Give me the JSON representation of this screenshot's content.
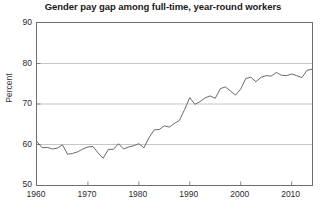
{
  "chart_data": {
    "type": "line",
    "title": "Gender pay gap among full-time, year-round workers",
    "xlabel": "",
    "ylabel": "Percent",
    "xlim": [
      1960,
      2014
    ],
    "ylim": [
      50,
      90
    ],
    "yticks": [
      50,
      60,
      70,
      80,
      90
    ],
    "xticks": [
      1960,
      1970,
      1980,
      1990,
      2000,
      2010
    ],
    "ytick_labels": [
      "50",
      "60",
      "70",
      "80",
      "90"
    ],
    "xtick_labels": [
      "1960",
      "1970",
      "1980",
      "1990",
      "2000",
      "2010"
    ],
    "gridlines": [
      60,
      70,
      80
    ],
    "grid": true,
    "legend": null,
    "line_color": "#5a5a5a",
    "grid_color": "#b9b9b9",
    "axis_color": "#6d6d6d",
    "series": [
      {
        "name": "Women's earnings as a percent of men's",
        "x": [
          1960,
          1961,
          1962,
          1963,
          1964,
          1965,
          1966,
          1967,
          1968,
          1969,
          1970,
          1971,
          1972,
          1973,
          1974,
          1975,
          1976,
          1977,
          1978,
          1979,
          1980,
          1981,
          1982,
          1983,
          1984,
          1985,
          1986,
          1987,
          1988,
          1989,
          1990,
          1991,
          1992,
          1993,
          1994,
          1995,
          1996,
          1997,
          1998,
          1999,
          2000,
          2001,
          2002,
          2003,
          2004,
          2005,
          2006,
          2007,
          2008,
          2009,
          2010,
          2011,
          2012,
          2013,
          2014
        ],
        "values": [
          60.7,
          59.2,
          59.3,
          58.9,
          59.1,
          59.9,
          57.6,
          57.8,
          58.2,
          58.9,
          59.4,
          59.5,
          57.9,
          56.6,
          58.8,
          58.8,
          60.2,
          58.9,
          59.4,
          59.7,
          60.2,
          59.2,
          61.7,
          63.6,
          63.7,
          64.6,
          64.3,
          65.2,
          66.0,
          68.7,
          71.6,
          69.9,
          70.6,
          71.5,
          72.0,
          71.4,
          73.8,
          74.2,
          73.2,
          72.2,
          73.7,
          76.3,
          76.6,
          75.5,
          76.6,
          77.0,
          76.9,
          77.8,
          77.1,
          77.0,
          77.4,
          77.0,
          76.5,
          78.3,
          78.6
        ]
      }
    ]
  }
}
